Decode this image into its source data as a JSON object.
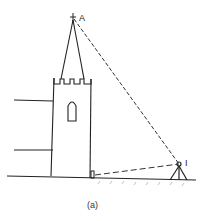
{
  "figure": {
    "caption": "(a)",
    "points": {
      "top": "A",
      "instrument": "I"
    },
    "colors": {
      "line": "#222222",
      "ground_hatch": "#888888"
    }
  }
}
